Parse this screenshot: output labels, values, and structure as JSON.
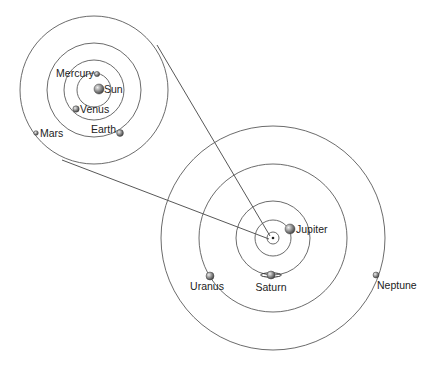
{
  "diagram": {
    "title": "",
    "inner_system": {
      "center": {
        "x": 94,
        "y": 90
      },
      "orbits": [
        {
          "name": "mercury-orbit",
          "r": 17
        },
        {
          "name": "venus-orbit",
          "r": 30
        },
        {
          "name": "earth-orbit",
          "r": 47
        },
        {
          "name": "mars-orbit",
          "r": 74
        }
      ],
      "bodies": [
        {
          "id": "sun",
          "label": "Sun",
          "x": 99,
          "y": 89,
          "r": 5
        },
        {
          "id": "mercury",
          "label": "Mercury",
          "x": 97,
          "y": 74,
          "r": 2.6
        },
        {
          "id": "venus",
          "label": "Venus",
          "x": 76,
          "y": 109,
          "r": 3.2
        },
        {
          "id": "earth",
          "label": "Earth",
          "x": 120,
          "y": 133,
          "r": 3.4
        },
        {
          "id": "mars",
          "label": "Mars",
          "x": 36,
          "y": 133,
          "r": 2.3
        }
      ]
    },
    "outer_system": {
      "center": {
        "x": 273,
        "y": 238
      },
      "orbits": [
        {
          "name": "inner-zoom-orbit",
          "r": 6
        },
        {
          "name": "jupiter-orbit",
          "r": 18
        },
        {
          "name": "saturn-orbit",
          "r": 37
        },
        {
          "name": "uranus-orbit",
          "r": 74
        },
        {
          "name": "neptune-orbit",
          "r": 112
        }
      ],
      "bodies": [
        {
          "id": "jupiter",
          "label": "Jupiter",
          "x": 290,
          "y": 229,
          "r": 5
        },
        {
          "id": "saturn",
          "label": "Saturn",
          "x": 271,
          "y": 275,
          "r": 4
        },
        {
          "id": "uranus",
          "label": "Uranus",
          "x": 210,
          "y": 276,
          "r": 4
        },
        {
          "id": "neptune",
          "label": "Neptune",
          "x": 376,
          "y": 275,
          "r": 3
        }
      ]
    },
    "connectors": [
      {
        "name": "zoom-line-top",
        "x1": 157,
        "y1": 45,
        "x2": 270,
        "y2": 236
      },
      {
        "name": "zoom-line-bottom",
        "x1": 62,
        "y1": 160,
        "x2": 269,
        "y2": 239
      }
    ],
    "colors": {
      "line": "#555555",
      "planet_light": "#d8d8d8",
      "planet_dark": "#555555"
    }
  }
}
